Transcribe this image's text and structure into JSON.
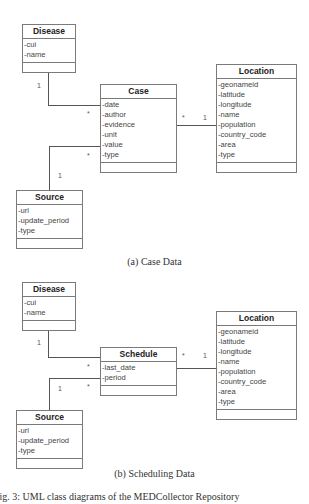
{
  "diagram_a": {
    "caption": "(a) Case Data",
    "classes": {
      "disease": {
        "name": "Disease",
        "attributes": [
          "-cui",
          "-name"
        ]
      },
      "case": {
        "name": "Case",
        "attributes": [
          "-date",
          "-author",
          "-evidence",
          "-unit",
          "-value",
          "-type"
        ]
      },
      "location": {
        "name": "Location",
        "attributes": [
          "-geonameid",
          "-latitude",
          "-longitude",
          "-name",
          "-population",
          "-country_code",
          "-area",
          "-type"
        ]
      },
      "source": {
        "name": "Source",
        "attributes": [
          "-url",
          "-update_period",
          "-type"
        ]
      }
    },
    "associations": {
      "disease_case": {
        "from": "Disease",
        "to": "Case",
        "from_mult": "1",
        "to_mult": "*"
      },
      "source_case": {
        "from": "Source",
        "to": "Case",
        "from_mult": "1",
        "to_mult": "*"
      },
      "case_location": {
        "from": "Case",
        "to": "Location",
        "from_mult": "*",
        "to_mult": "1"
      }
    }
  },
  "diagram_b": {
    "caption": "(b) Scheduling Data",
    "classes": {
      "disease": {
        "name": "Disease",
        "attributes": [
          "-cui",
          "-name"
        ]
      },
      "schedule": {
        "name": "Schedule",
        "attributes": [
          "-last_date",
          "-period"
        ]
      },
      "location": {
        "name": "Location",
        "attributes": [
          "-geonameid",
          "-latitude",
          "-longitude",
          "-name",
          "-population",
          "-country_code",
          "-area",
          "-type"
        ]
      },
      "source": {
        "name": "Source",
        "attributes": [
          "-url",
          "-update_period",
          "-type"
        ]
      }
    },
    "associations": {
      "disease_schedule": {
        "from": "Disease",
        "to": "Schedule",
        "from_mult": "1",
        "to_mult": "*"
      },
      "source_schedule": {
        "from": "Source",
        "to": "Schedule",
        "from_mult": "1",
        "to_mult": "*"
      },
      "schedule_location": {
        "from": "Schedule",
        "to": "Location",
        "from_mult": "*",
        "to_mult": "1"
      }
    }
  },
  "figure_caption": "Fig. 3: UML class diagrams of the MEDCollector Repository"
}
